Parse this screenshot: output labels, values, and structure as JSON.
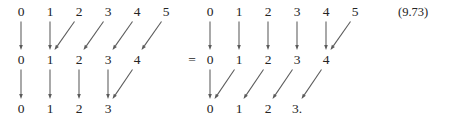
{
  "figure": {
    "equation_number": "(9.73)",
    "relation_symbol": "=",
    "relation_symbol_x": 192,
    "relation_symbol_y": 53,
    "equation_number_x": 398,
    "equation_number_y": 6,
    "geometry": {
      "row_y": [
        5,
        53,
        102
      ],
      "col_step": 29,
      "left_origin_x": 21,
      "right_origin_x": 210
    },
    "arrow_style": {
      "color": "#5a5a5a",
      "stroke_width": 1.05,
      "head_length": 5.0,
      "head_width": 3.6
    },
    "diagrams": [
      {
        "name": "left-diagram",
        "origin_x": 21,
        "rows": [
          {
            "name": "top-row",
            "y": 5,
            "labels": [
              "0",
              "1",
              "2",
              "3",
              "4",
              "5"
            ]
          },
          {
            "name": "middle-row",
            "y": 53,
            "labels": [
              "0",
              "1",
              "2",
              "3",
              "4"
            ]
          },
          {
            "name": "bottom-row",
            "y": 102,
            "labels": [
              "0",
              "1",
              "2",
              "3"
            ]
          }
        ],
        "arrows": [
          {
            "name": "vertical-arrow",
            "from_row": 0,
            "from_col": 0,
            "to_row": 1,
            "to_col": 0
          },
          {
            "name": "vertical-arrow",
            "from_row": 0,
            "from_col": 1,
            "to_row": 1,
            "to_col": 1
          },
          {
            "name": "diagonal-arrow",
            "from_row": 0,
            "from_col": 2,
            "to_row": 1,
            "to_col": 1
          },
          {
            "name": "diagonal-arrow",
            "from_row": 0,
            "from_col": 3,
            "to_row": 1,
            "to_col": 2
          },
          {
            "name": "diagonal-arrow",
            "from_row": 0,
            "from_col": 4,
            "to_row": 1,
            "to_col": 3
          },
          {
            "name": "diagonal-arrow",
            "from_row": 0,
            "from_col": 5,
            "to_row": 1,
            "to_col": 4
          },
          {
            "name": "vertical-arrow",
            "from_row": 1,
            "from_col": 0,
            "to_row": 2,
            "to_col": 0
          },
          {
            "name": "vertical-arrow",
            "from_row": 1,
            "from_col": 1,
            "to_row": 2,
            "to_col": 1
          },
          {
            "name": "vertical-arrow",
            "from_row": 1,
            "from_col": 2,
            "to_row": 2,
            "to_col": 2
          },
          {
            "name": "vertical-arrow",
            "from_row": 1,
            "from_col": 3,
            "to_row": 2,
            "to_col": 3
          },
          {
            "name": "diagonal-arrow",
            "from_row": 1,
            "from_col": 4,
            "to_row": 2,
            "to_col": 3
          }
        ]
      },
      {
        "name": "right-diagram",
        "origin_x": 210,
        "rows": [
          {
            "name": "top-row",
            "y": 5,
            "labels": [
              "0",
              "1",
              "2",
              "3",
              "4",
              "5"
            ]
          },
          {
            "name": "middle-row",
            "y": 53,
            "labels": [
              "0",
              "1",
              "2",
              "3",
              "4"
            ]
          },
          {
            "name": "bottom-row",
            "y": 102,
            "labels": [
              "0",
              "1",
              "2",
              "3."
            ]
          }
        ],
        "arrows": [
          {
            "name": "vertical-arrow",
            "from_row": 0,
            "from_col": 0,
            "to_row": 1,
            "to_col": 0
          },
          {
            "name": "vertical-arrow",
            "from_row": 0,
            "from_col": 1,
            "to_row": 1,
            "to_col": 1
          },
          {
            "name": "vertical-arrow",
            "from_row": 0,
            "from_col": 2,
            "to_row": 1,
            "to_col": 2
          },
          {
            "name": "vertical-arrow",
            "from_row": 0,
            "from_col": 3,
            "to_row": 1,
            "to_col": 3
          },
          {
            "name": "vertical-arrow",
            "from_row": 0,
            "from_col": 4,
            "to_row": 1,
            "to_col": 4
          },
          {
            "name": "diagonal-arrow",
            "from_row": 0,
            "from_col": 5,
            "to_row": 1,
            "to_col": 4
          },
          {
            "name": "vertical-arrow",
            "from_row": 1,
            "from_col": 0,
            "to_row": 2,
            "to_col": 0
          },
          {
            "name": "diagonal-arrow",
            "from_row": 1,
            "from_col": 1,
            "to_row": 2,
            "to_col": 0
          },
          {
            "name": "diagonal-arrow",
            "from_row": 1,
            "from_col": 2,
            "to_row": 2,
            "to_col": 1
          },
          {
            "name": "diagonal-arrow",
            "from_row": 1,
            "from_col": 3,
            "to_row": 2,
            "to_col": 2
          },
          {
            "name": "diagonal-arrow",
            "from_row": 1,
            "from_col": 4,
            "to_row": 2,
            "to_col": 3
          }
        ]
      }
    ]
  }
}
